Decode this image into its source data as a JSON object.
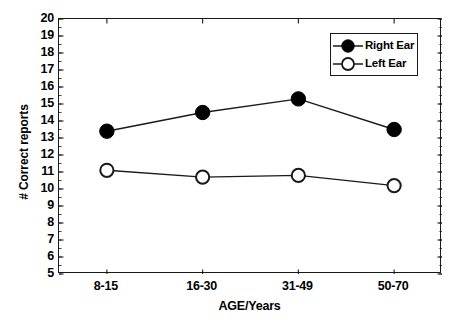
{
  "chart_data": {
    "type": "line",
    "title": "",
    "xlabel": "AGE/Years",
    "ylabel": "# Correct reports",
    "categories": [
      "8-15",
      "16-30",
      "31-49",
      "50-70"
    ],
    "series": [
      {
        "name": "Right Ear",
        "marker": "filled-circle",
        "values": [
          13.4,
          14.5,
          15.3,
          13.5
        ]
      },
      {
        "name": "Left Ear",
        "marker": "open-circle",
        "values": [
          11.1,
          10.7,
          10.8,
          10.2
        ]
      }
    ],
    "ylim": [
      5,
      20
    ],
    "ytick_labels": [
      "20",
      "19",
      "18",
      "17",
      "16",
      "15",
      "14",
      "13",
      "12",
      "11",
      "10",
      "9",
      "8",
      "7",
      "6",
      "5"
    ],
    "ytick_values": [
      20,
      19,
      18,
      17,
      16,
      15,
      14,
      13,
      12,
      11,
      10,
      9,
      8,
      7,
      6,
      5
    ],
    "grid": false,
    "legend_position": "upper-right",
    "colors": {
      "line": "#1a1a1a",
      "axis": "#1a1a1a",
      "filled_marker": "#000000",
      "open_marker_fill": "#ffffff",
      "background": "#ffffff"
    }
  }
}
